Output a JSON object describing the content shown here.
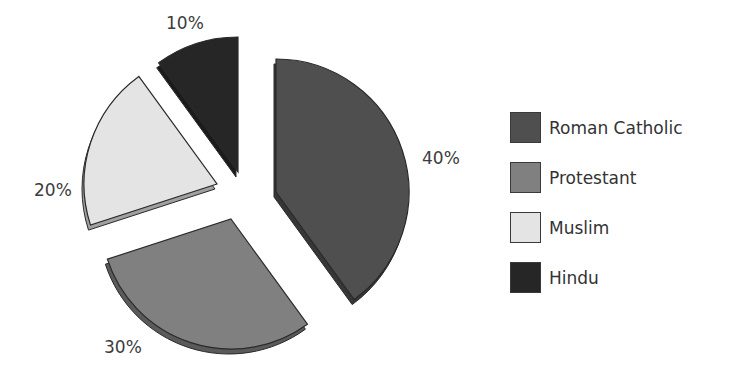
{
  "chart_data": {
    "type": "pie",
    "title": "",
    "style": "exploded 3D pie",
    "categories": [
      "Roman Catholic",
      "Protestant",
      "Muslim",
      "Hindu"
    ],
    "values": [
      40,
      30,
      20,
      10
    ],
    "labels": [
      "40%",
      "30%",
      "20%",
      "10%"
    ],
    "colors": [
      "#4f4f4f",
      "#808080",
      "#e4e4e4",
      "#262626"
    ],
    "legend_position": "right"
  },
  "legend": {
    "items": [
      {
        "label": "Roman Catholic",
        "color": "#4f4f4f"
      },
      {
        "label": "Protestant",
        "color": "#808080"
      },
      {
        "label": "Muslim",
        "color": "#e4e4e4"
      },
      {
        "label": "Hindu",
        "color": "#262626"
      }
    ]
  }
}
